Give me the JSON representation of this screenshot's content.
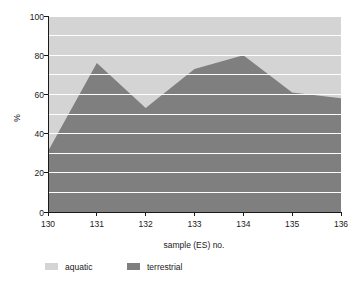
{
  "chart_data": {
    "type": "area",
    "title": "",
    "subtitle": "",
    "xlabel": "sample (ES) no.",
    "ylabel": "%",
    "x": [
      130,
      131,
      132,
      133,
      134,
      135,
      136
    ],
    "categories": [
      "130",
      "131",
      "132",
      "133",
      "134",
      "135",
      "136"
    ],
    "series": [
      {
        "name": "terrestrial",
        "values": [
          31,
          76,
          53,
          73,
          80,
          61,
          58
        ],
        "color": "#807f80",
        "stack_order": 0
      },
      {
        "name": "aquatic",
        "values": [
          69,
          24,
          47,
          27,
          20,
          39,
          42
        ],
        "color": "#d4d4d4",
        "stack_order": 1
      }
    ],
    "stacked": true,
    "xlim": [
      130,
      136
    ],
    "ylim": [
      0,
      100
    ],
    "ytick_labels": [
      "0",
      "20",
      "40",
      "60",
      "80",
      "100"
    ],
    "ytick_values": [
      0,
      20,
      40,
      60,
      80,
      100
    ],
    "xtick_labels": [
      "130",
      "131",
      "132",
      "133",
      "134",
      "135",
      "136"
    ],
    "xtick_values": [
      130,
      131,
      132,
      133,
      134,
      135,
      136
    ],
    "minor_gridline_step": 10,
    "grid": true,
    "grid_color": "#ffffff",
    "legend_position": "bottom-left",
    "legend": [
      {
        "label": "aquatic",
        "color": "#d4d4d4"
      },
      {
        "label": "terrestrial",
        "color": "#807f80"
      }
    ],
    "background_color": "#ffffff",
    "axis_color": "#1a1a1a"
  },
  "axes": {
    "y_axis_title": "%",
    "x_axis_title": "sample (ES) no."
  },
  "ylabels": {
    "t0": "0",
    "t1": "20",
    "t2": "40",
    "t3": "60",
    "t4": "80",
    "t5": "100"
  },
  "xlabels": {
    "t0": "130",
    "t1": "131",
    "t2": "132",
    "t3": "133",
    "t4": "134",
    "t5": "135",
    "t6": "136"
  },
  "legend": {
    "item0_label": "aquatic",
    "item1_label": "terrestrial"
  }
}
